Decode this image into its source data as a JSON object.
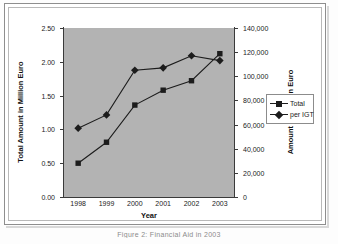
{
  "figure": {
    "caption": "Figure 2: Financial Aid in 2003"
  },
  "chart_data": {
    "type": "line",
    "title": "",
    "xlabel": "Year",
    "categories": [
      "1998",
      "1999",
      "2000",
      "2001",
      "2002",
      "2003"
    ],
    "grid": false,
    "plot_background": "#b3b3b3",
    "legend_position": "right",
    "axes": {
      "left": {
        "label": "Total Amount in Million Euro",
        "ticks": [
          "0.00",
          "0.50",
          "1.00",
          "1.50",
          "2.00",
          "2.50"
        ],
        "tick_values": [
          0,
          0.5,
          1.0,
          1.5,
          2.0,
          2.5
        ],
        "ylim": [
          0,
          2.5
        ]
      },
      "right": {
        "label": "Amount per IGT in Euro",
        "ticks": [
          "0",
          "20,000",
          "40,000",
          "60,000",
          "80,000",
          "100,000",
          "120,000",
          "140,000"
        ],
        "tick_values": [
          0,
          20000,
          40000,
          60000,
          80000,
          100000,
          120000,
          140000
        ],
        "ylim": [
          0,
          140000
        ]
      }
    },
    "series": [
      {
        "name": "Total",
        "axis": "left",
        "marker": "square",
        "color": "#1c1c1c",
        "values": [
          0.5,
          0.81,
          1.36,
          1.58,
          1.72,
          2.12
        ]
      },
      {
        "name": "per IGT",
        "axis": "right",
        "marker": "diamond",
        "color": "#1c1c1c",
        "values": [
          57000,
          68000,
          105000,
          107000,
          117000,
          113000
        ]
      }
    ]
  }
}
